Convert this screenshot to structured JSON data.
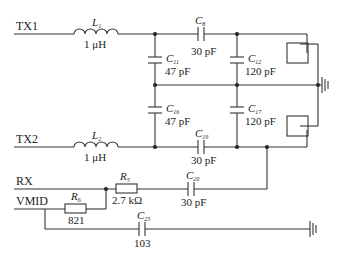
{
  "schematic": {
    "nets": {
      "tx1": "TX1",
      "tx2": "TX2",
      "rx": "RX",
      "vmid": "VMID"
    },
    "components": {
      "L1": {
        "ref": "L",
        "sub": "1",
        "value": "1 μH"
      },
      "L2": {
        "ref": "L",
        "sub": "2",
        "value": "1 μH"
      },
      "C8": {
        "ref": "C",
        "sub": "8",
        "value": "30 pF"
      },
      "C11": {
        "ref": "C",
        "sub": "11",
        "value": "47 pF"
      },
      "C12": {
        "ref": "C",
        "sub": "12",
        "value": "120 pF"
      },
      "C16": {
        "ref": "C",
        "sub": "16",
        "value": "47 pF"
      },
      "C17": {
        "ref": "C",
        "sub": "17",
        "value": "120 pF"
      },
      "C19": {
        "ref": "C",
        "sub": "19",
        "value": "30 pF"
      },
      "C20": {
        "ref": "C",
        "sub": "20",
        "value": "30 pF"
      },
      "C25": {
        "ref": "C",
        "sub": "25",
        "value": "103"
      },
      "R5": {
        "ref": "R",
        "sub": "5",
        "value": "2.7 kΩ"
      },
      "R6": {
        "ref": "R",
        "sub": "6",
        "value": "821"
      }
    },
    "antennas": [
      "top-antenna-box",
      "bottom-antenna-box"
    ],
    "grounds": [
      "ground-main",
      "ground-vmid"
    ]
  }
}
